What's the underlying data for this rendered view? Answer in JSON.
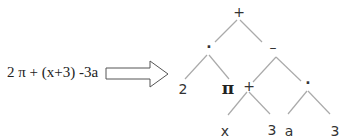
{
  "expression": "2 π + (x+3) -3a",
  "arrow": {
    "direction": "right",
    "label": ""
  },
  "tree": {
    "nodes": [
      {
        "id": "root",
        "label": "+",
        "x": 239,
        "y": 12
      },
      {
        "id": "mul1",
        "label": "·",
        "x": 209,
        "y": 47
      },
      {
        "id": "minus",
        "label": "–",
        "x": 273,
        "y": 47
      },
      {
        "id": "two",
        "label": "2",
        "x": 183,
        "y": 89
      },
      {
        "id": "pi",
        "label": "π",
        "x": 228,
        "y": 88
      },
      {
        "id": "plus2",
        "label": "+",
        "x": 249,
        "y": 86
      },
      {
        "id": "mul2",
        "label": "·",
        "x": 308,
        "y": 83
      },
      {
        "id": "x",
        "label": "x",
        "x": 225,
        "y": 131
      },
      {
        "id": "three1",
        "label": "3",
        "x": 272,
        "y": 130
      },
      {
        "id": "a",
        "label": "a",
        "x": 289,
        "y": 131
      },
      {
        "id": "three2",
        "label": "3",
        "x": 335,
        "y": 131
      }
    ],
    "edges": [
      [
        "root",
        "mul1"
      ],
      [
        "root",
        "minus"
      ],
      [
        "mul1",
        "two"
      ],
      [
        "mul1",
        "pi"
      ],
      [
        "minus",
        "plus2"
      ],
      [
        "minus",
        "mul2"
      ],
      [
        "plus2",
        "x"
      ],
      [
        "plus2",
        "three1"
      ],
      [
        "mul2",
        "a"
      ],
      [
        "mul2",
        "three2"
      ]
    ]
  }
}
